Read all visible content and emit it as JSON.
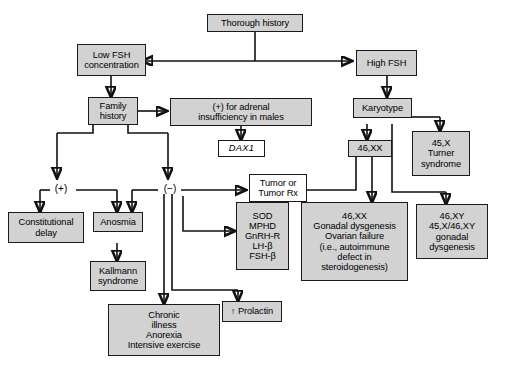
{
  "diagram": {
    "fill_color": "#d2d2d2",
    "line_color": "#111111",
    "plain_color": "#ffffff",
    "nodes": {
      "thorough_history": "Thorough history",
      "low_fsh": "Low FSH\nconcentration",
      "high_fsh": "High FSH",
      "family_history": "Family\nhistory",
      "adrenal_insufficiency": "(+) for adrenal\ninsufficiency in males",
      "dax1": "DAX1",
      "karyotype": "Karyotype",
      "turner": "45,X\nTurner\nsyndrome",
      "xx46": "46,XX",
      "plus_sign": "(+)",
      "minus_sign": "(−)",
      "tumor": "Tumor or\nTumor Rx",
      "constitutional_delay": "Constitutional\ndelay",
      "anosmia": "Anosmia",
      "kallmann": "Kallmann\nsyndrome",
      "gene_panel": "SOD\nMPHD\nGnRH-R\nLH-β\nFSH-β",
      "gonadal_dysgenesis_xx": "46,XX\nGonadal dysgenesis\nOvarian failure\n(i.e., autoimmune\ndefect in\nsteroidogenesis)",
      "gonadal_dysgenesis_xy": "46,XY\n45,X/46,XY\ngonadal\ndysgenesis",
      "chronic_illness": "Chronic\nillness\nAnorexia\nIntensive exercise",
      "prolactin": "↑ Prolactin"
    }
  }
}
